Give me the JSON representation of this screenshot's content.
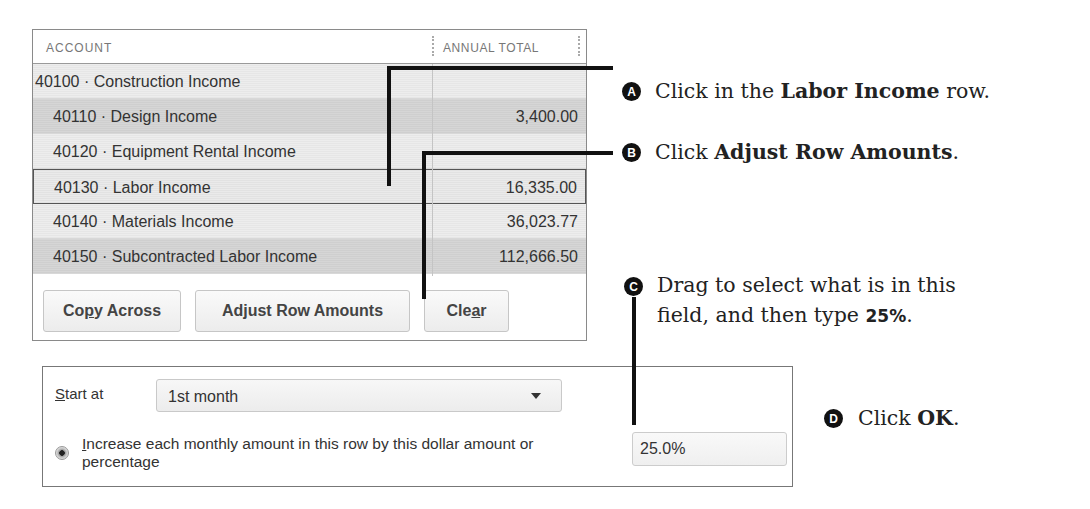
{
  "grid": {
    "columns": {
      "account": "ACCOUNT",
      "annual_total": "ANNUAL TOTAL"
    },
    "rows": [
      {
        "account": "40100 · Construction Income",
        "annual_total": "",
        "style": "parent"
      },
      {
        "account": "40110 · Design Income",
        "annual_total": "3,400.00",
        "style": "dark"
      },
      {
        "account": "40120 · Equipment Rental Income",
        "annual_total": "",
        "style": "light"
      },
      {
        "account": "40130 · Labor Income",
        "annual_total": "16,335.00",
        "style": "selected"
      },
      {
        "account": "40140 · Materials Income",
        "annual_total": "36,023.77",
        "style": "light"
      },
      {
        "account": "40150 · Subcontracted Labor Income",
        "annual_total": "112,666.50",
        "style": "dark"
      }
    ],
    "buttons": {
      "copy_across": {
        "pre": "Co",
        "mnemonic": "p",
        "post": "y Across"
      },
      "adjust_row_amounts": "Adjust Row Amounts",
      "clear": {
        "pre": "Cle",
        "mnemonic": "a",
        "post": "r"
      }
    }
  },
  "adjust": {
    "start_at": {
      "label_mnemonic": "S",
      "label_rest": "tart at",
      "value": "1st month"
    },
    "increase_option": {
      "label_mnemonic": "I",
      "label_rest": "ncrease each monthly amount in this row by this dollar amount or percentage",
      "selected": true
    },
    "amount_value": "25.0%"
  },
  "callouts": [
    {
      "badge": "A",
      "pre": "Click in the ",
      "bold": "Labor Income",
      "post": " row."
    },
    {
      "badge": "B",
      "pre": "Click ",
      "bold": "Adjust Row Amounts",
      "post": "."
    },
    {
      "badge": "C",
      "line1": "Drag to select what is in this",
      "line2_pre": "field, and then type ",
      "line2_bold": "25%",
      "line2_post": "."
    },
    {
      "badge": "D",
      "pre": "Click ",
      "bold": "OK",
      "post": "."
    }
  ]
}
